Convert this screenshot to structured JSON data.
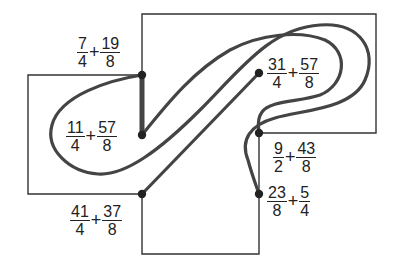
{
  "diagram": {
    "type": "matching-path puzzle",
    "colors": {
      "line": "#333333",
      "path": "#444444",
      "dot": "#222222",
      "background": "#ffffff"
    },
    "points": [
      {
        "id": "A",
        "label": {
          "a_num": "7",
          "a_den": "4",
          "op": "+",
          "b_num": "19",
          "b_den": "8"
        }
      },
      {
        "id": "B",
        "label": {
          "a_num": "11",
          "a_den": "4",
          "op": "+",
          "b_num": "57",
          "b_den": "8"
        }
      },
      {
        "id": "C",
        "label": {
          "a_num": "41",
          "a_den": "4",
          "op": "+",
          "b_num": "37",
          "b_den": "8"
        }
      },
      {
        "id": "D",
        "label": {
          "a_num": "31",
          "a_den": "4",
          "op": "+",
          "b_num": "57",
          "b_den": "8"
        }
      },
      {
        "id": "E",
        "label": {
          "a_num": "9",
          "a_den": "2",
          "op": "+",
          "b_num": "43",
          "b_den": "8"
        }
      },
      {
        "id": "F",
        "label": {
          "a_num": "23",
          "a_den": "8",
          "op": "+",
          "b_num": "5",
          "b_den": "4"
        }
      }
    ],
    "connections": [
      [
        "A",
        "B"
      ],
      [
        "B",
        "D"
      ],
      [
        "C",
        "E"
      ],
      [
        "A",
        "F"
      ]
    ]
  }
}
